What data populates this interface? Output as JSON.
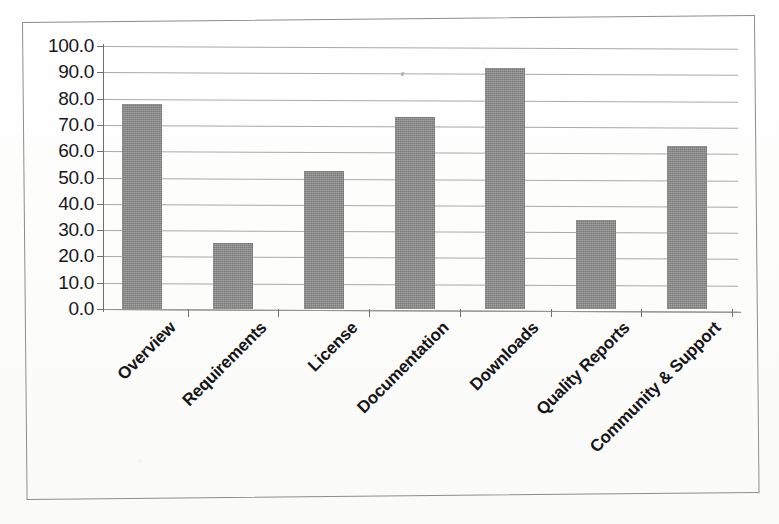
{
  "chart_data": {
    "type": "bar",
    "title": "",
    "subtitle": "",
    "xlabel": "",
    "ylabel": "",
    "categories": [
      "Overview",
      "Requirements",
      "License",
      "Documentation",
      "Downloads",
      "Quality Reports",
      "Community & Support"
    ],
    "values": [
      78.0,
      25.0,
      52.5,
      73.0,
      91.5,
      34.0,
      62.0
    ],
    "ylim": [
      0.0,
      100.0
    ],
    "ytick_labels": [
      "100.0",
      "90.0",
      "80.0",
      "70.0",
      "60.0",
      "50.0",
      "40.0",
      "30.0",
      "20.0",
      "10.0",
      "0.0"
    ],
    "ytick_values": [
      100.0,
      90.0,
      80.0,
      70.0,
      60.0,
      50.0,
      40.0,
      30.0,
      20.0,
      10.0,
      0.0
    ],
    "ytick_step": 10.0,
    "grid": true,
    "grid_axis": "y",
    "legend": false,
    "legend_position": "none",
    "series": [
      {
        "name": "",
        "values": [
          78.0,
          25.0,
          52.5,
          73.0,
          91.5,
          34.0,
          62.0
        ]
      }
    ],
    "bar_color": "#8c8c8c",
    "axis_color": "#6f6f6f",
    "grid_color": "#9a9a9a",
    "text_color": "#17181a",
    "background": "#fdfdfc",
    "xtick_label_rotation": -45
  },
  "figure": {
    "frame_border_color": "#8d8d8d",
    "has_outer_frame": true
  }
}
